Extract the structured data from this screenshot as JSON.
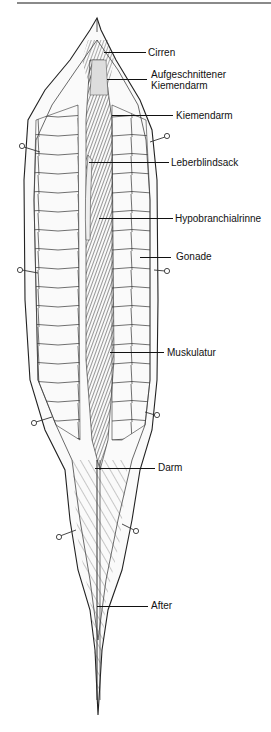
{
  "figure": {
    "labels": [
      {
        "id": "cirren",
        "text": "Cirren",
        "x": 148,
        "y": 47
      },
      {
        "id": "aufgeschnittener-kiemendarm",
        "text": "Aufgeschnittener\nKiemendarm",
        "x": 151,
        "y": 69
      },
      {
        "id": "kiemendarm",
        "text": "Kiemendarm",
        "x": 176,
        "y": 110
      },
      {
        "id": "leberblindsack",
        "text": "Leberblindsack",
        "x": 171,
        "y": 157
      },
      {
        "id": "hypobranchialrinne",
        "text": "Hypobranchialrinne",
        "x": 175,
        "y": 213
      },
      {
        "id": "gonade",
        "text": "Gonade",
        "x": 176,
        "y": 251
      },
      {
        "id": "muskulatur",
        "text": "Muskulatur",
        "x": 167,
        "y": 347
      },
      {
        "id": "darm",
        "text": "Darm",
        "x": 158,
        "y": 462
      },
      {
        "id": "after",
        "text": "After",
        "x": 151,
        "y": 600
      }
    ],
    "leaders": [
      {
        "id": "cirren",
        "x1": 104,
        "x2": 146,
        "y": 52
      },
      {
        "id": "aufgeschnittener-kiemendarm",
        "x1": 107,
        "x2": 147,
        "y": 79
      },
      {
        "id": "kiemendarm",
        "x1": 112,
        "x2": 173,
        "y": 115
      },
      {
        "id": "leberblindsack",
        "x1": 89,
        "x2": 169,
        "y": 162
      },
      {
        "id": "hypobranchialrinne",
        "x1": 99,
        "x2": 173,
        "y": 218
      },
      {
        "id": "gonade",
        "x1": 140,
        "x2": 171,
        "y": 257
      },
      {
        "id": "muskulatur",
        "x1": 110,
        "x2": 164,
        "y": 352
      },
      {
        "id": "darm",
        "x1": 95,
        "x2": 155,
        "y": 468
      },
      {
        "id": "after",
        "x1": 97,
        "x2": 148,
        "y": 606
      }
    ]
  }
}
